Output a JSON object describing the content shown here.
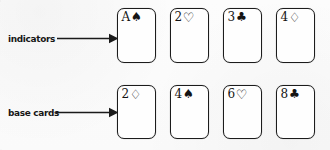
{
  "figure": {
    "kind": "hand-drawn card layout diagram",
    "background_color": "#fdfdfd",
    "ink_color": "#1a1a1a"
  },
  "annotations": [
    {
      "id": "indicators",
      "label": "indicators",
      "arrow": "rightwards-arrow",
      "points_to": "row-indicators"
    },
    {
      "id": "base-cards",
      "label": "base cards",
      "arrow": "rightwards-arrow",
      "points_to": "row-base-cards"
    }
  ],
  "rows": [
    {
      "id": "indicators",
      "label": "indicators",
      "cards": [
        {
          "rank": "A",
          "suit_glyph": "♠",
          "suit_name": "spade-icon",
          "filled": true
        },
        {
          "rank": "2",
          "suit_glyph": "♡",
          "suit_name": "heart-icon",
          "filled": false
        },
        {
          "rank": "3",
          "suit_glyph": "♣",
          "suit_name": "club-icon",
          "filled": true
        },
        {
          "rank": "4",
          "suit_glyph": "♢",
          "suit_name": "diamond-icon",
          "filled": false
        }
      ]
    },
    {
      "id": "base-cards",
      "label": "base cards",
      "cards": [
        {
          "rank": "2",
          "suit_glyph": "♢",
          "suit_name": "diamond-icon",
          "filled": false
        },
        {
          "rank": "4",
          "suit_glyph": "♠",
          "suit_name": "spade-icon",
          "filled": true
        },
        {
          "rank": "6",
          "suit_glyph": "♡",
          "suit_name": "heart-icon",
          "filled": false
        },
        {
          "rank": "8",
          "suit_glyph": "♣",
          "suit_name": "club-icon",
          "filled": true
        }
      ]
    }
  ]
}
